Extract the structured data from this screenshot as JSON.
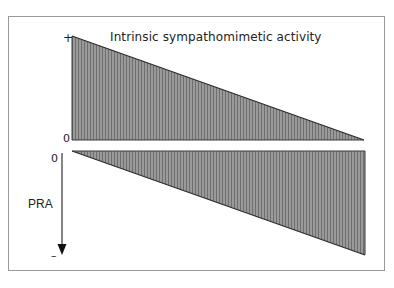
{
  "diagram": {
    "title": "Intrinsic sympathomimetic activity",
    "top_panel": {
      "y_max_label": "+",
      "y_zero_label": "0",
      "shape": "triangle decreasing from + at left to 0 at right"
    },
    "bottom_panel": {
      "y_zero_label": "0",
      "y_min_label": "–",
      "axis_label": "PRA",
      "shape": "triangle decreasing from 0 at left to – at right"
    },
    "colors": {
      "fill": "#8a8a8a",
      "stroke": "#2a2a2a",
      "frame": "#9a9a9a"
    }
  }
}
